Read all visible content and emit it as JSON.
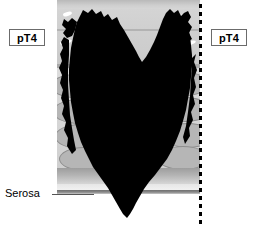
{
  "figure": {
    "type": "histology-staging-diagram",
    "title_visible": false,
    "stage_code": "pT4"
  },
  "labels": {
    "stage_left": "pT4",
    "stage_right": "pT4",
    "serosa": "Serosa"
  },
  "colors": {
    "tumor": "#000000",
    "mucosa": "#d4d4d4",
    "muscularis": "#d8d8d8",
    "muscle_bundle_fill": "#b6b6b6",
    "muscle_bundle_stroke": "#8e8e8e",
    "subserosa": "#b4b4b4",
    "serosa_line": "#6f6f6f",
    "margin_line": "#000000",
    "label_border": "#6b6b6b",
    "label_text": "#000000",
    "background": "#ffffff"
  },
  "layers": [
    {
      "name": "mucosa",
      "top": 0,
      "height": 68
    },
    {
      "name": "muscularis-propria",
      "top": 68,
      "height": 100
    },
    {
      "name": "subserosa",
      "top": 168,
      "height": 16
    },
    {
      "name": "serosa",
      "top": 190,
      "height": 4
    }
  ],
  "crypts": [
    {
      "left": 6,
      "top": 12,
      "w": 9,
      "h": 4
    },
    {
      "left": 3,
      "top": 40,
      "w": 12,
      "h": 4
    },
    {
      "left": 124,
      "top": 13,
      "w": 9,
      "h": 4
    },
    {
      "left": 127,
      "top": 41,
      "w": 12,
      "h": 4
    }
  ],
  "muscle_bundles": [
    {
      "left": -6,
      "top": 6,
      "w": 46,
      "h": 22
    },
    {
      "left": -4,
      "top": 31,
      "w": 50,
      "h": 23
    },
    {
      "left": -2,
      "top": 56,
      "w": 48,
      "h": 23
    },
    {
      "left": 2,
      "top": 79,
      "w": 48,
      "h": 22
    },
    {
      "left": 104,
      "top": 4,
      "w": 46,
      "h": 22
    },
    {
      "left": 102,
      "top": 29,
      "w": 50,
      "h": 23
    },
    {
      "left": 106,
      "top": 55,
      "w": 48,
      "h": 23
    },
    {
      "left": 100,
      "top": 78,
      "w": 50,
      "h": 22
    }
  ],
  "margin_line": {
    "x": 199,
    "style": "dotted",
    "orientation": "vertical"
  },
  "serosa_leader": {
    "from_x": 52,
    "to_x": 94,
    "y": 194
  }
}
